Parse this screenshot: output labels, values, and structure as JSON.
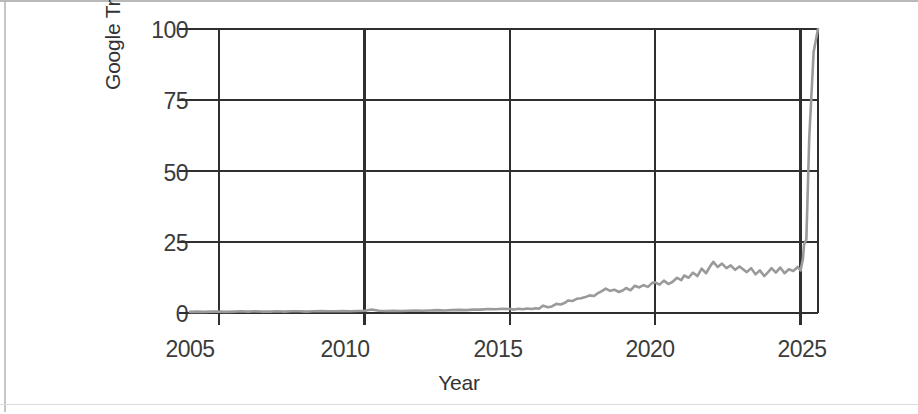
{
  "chart_data": {
    "type": "line",
    "title": "",
    "xlabel": "Year",
    "ylabel": "Google Trends interest",
    "xlim": [
      2004.0,
      2025.6
    ],
    "ylim": [
      0,
      100
    ],
    "xticks": [
      2005,
      2010,
      2015,
      2020,
      2025
    ],
    "xtick_labels": [
      "2005",
      "2010",
      "2015",
      "2020",
      "2025"
    ],
    "yticks": [
      0,
      25,
      50,
      75,
      100
    ],
    "ytick_labels": [
      "0",
      "25",
      "50",
      "75",
      "100"
    ],
    "grid": true,
    "legend": "none",
    "series": [
      {
        "name": "Google Trends interest",
        "color": "#9a9a9a",
        "x": [
          2004.0,
          2004.25,
          2004.5,
          2004.75,
          2005.0,
          2005.25,
          2005.5,
          2005.75,
          2006.0,
          2006.25,
          2006.5,
          2006.75,
          2007.0,
          2007.25,
          2007.5,
          2007.75,
          2008.0,
          2008.25,
          2008.5,
          2008.75,
          2009.0,
          2009.25,
          2009.5,
          2009.75,
          2010.0,
          2010.25,
          2010.5,
          2010.75,
          2011.0,
          2011.25,
          2011.5,
          2011.75,
          2012.0,
          2012.25,
          2012.5,
          2012.75,
          2013.0,
          2013.25,
          2013.5,
          2013.75,
          2014.0,
          2014.25,
          2014.5,
          2014.75,
          2015.0,
          2015.15,
          2015.3,
          2015.45,
          2015.6,
          2015.75,
          2015.9,
          2016.0,
          2016.15,
          2016.3,
          2016.45,
          2016.6,
          2016.75,
          2016.9,
          2017.0,
          2017.15,
          2017.3,
          2017.45,
          2017.6,
          2017.75,
          2017.9,
          2018.0,
          2018.15,
          2018.3,
          2018.45,
          2018.6,
          2018.75,
          2018.9,
          2019.0,
          2019.15,
          2019.3,
          2019.45,
          2019.6,
          2019.75,
          2019.9,
          2020.0,
          2020.15,
          2020.3,
          2020.45,
          2020.6,
          2020.75,
          2020.9,
          2021.0,
          2021.15,
          2021.3,
          2021.45,
          2021.6,
          2021.75,
          2021.9,
          2022.0,
          2022.15,
          2022.3,
          2022.45,
          2022.6,
          2022.75,
          2022.9,
          2023.0,
          2023.15,
          2023.3,
          2023.45,
          2023.6,
          2023.75,
          2023.9,
          2024.0,
          2024.15,
          2024.3,
          2024.45,
          2024.6,
          2024.75,
          2024.9,
          2025.0,
          2025.08,
          2025.12,
          2025.16,
          2025.2,
          2025.3,
          2025.45,
          2025.6
        ],
        "y": [
          0.4,
          0.5,
          0.4,
          0.5,
          0.5,
          0.4,
          0.5,
          0.6,
          0.5,
          0.6,
          0.5,
          0.5,
          0.6,
          0.5,
          0.6,
          0.6,
          0.5,
          0.6,
          0.7,
          0.6,
          0.6,
          0.7,
          0.6,
          0.7,
          0.8,
          1.2,
          0.8,
          0.7,
          0.8,
          0.7,
          0.8,
          0.9,
          0.8,
          0.9,
          1.0,
          0.9,
          1.0,
          1.1,
          1.0,
          1.2,
          1.2,
          1.4,
          1.3,
          1.5,
          1.4,
          1.2,
          1.5,
          1.3,
          1.6,
          1.4,
          1.7,
          1.5,
          2.6,
          2.0,
          2.3,
          3.2,
          3.0,
          3.6,
          4.4,
          4.2,
          5.0,
          5.2,
          5.6,
          6.2,
          6.0,
          6.8,
          7.6,
          8.6,
          7.8,
          8.2,
          7.4,
          8.0,
          8.8,
          8.0,
          9.6,
          9.0,
          9.8,
          9.2,
          10.6,
          10.8,
          10.0,
          11.4,
          10.2,
          11.0,
          12.4,
          11.6,
          13.2,
          12.4,
          14.2,
          13.0,
          15.6,
          14.0,
          16.6,
          18.0,
          16.2,
          17.4,
          15.8,
          16.8,
          15.2,
          16.4,
          15.6,
          14.4,
          15.8,
          13.6,
          15.0,
          13.0,
          14.6,
          15.8,
          14.2,
          16.0,
          14.0,
          15.4,
          14.8,
          16.2,
          15.0,
          19.0,
          24.0,
          25.0,
          26.0,
          62.0,
          92.0,
          100.0
        ]
      }
    ]
  }
}
